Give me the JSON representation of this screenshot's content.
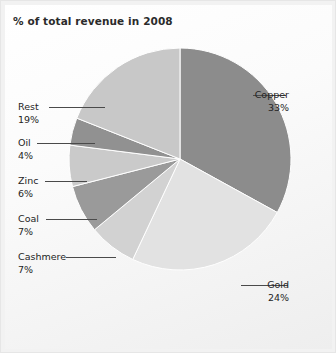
{
  "chart": {
    "title": "% of total revenue in 2008"
  },
  "chart_data": {
    "type": "pie",
    "title": "% of total revenue in 2008",
    "xlabel": "",
    "ylabel": "",
    "legend_position": "none",
    "grid": false,
    "unit": "%",
    "total": 100,
    "start_angle_deg": 0,
    "direction": "clockwise",
    "labels": [
      "Copper",
      "Gold",
      "Cashmere",
      "Coal",
      "Zinc",
      "Oil",
      "Rest"
    ],
    "values": [
      33,
      24,
      7,
      7,
      6,
      4,
      19
    ],
    "value_labels": [
      "33%",
      "24%",
      "7%",
      "7%",
      "6%",
      "4%",
      "19%"
    ],
    "colors": [
      "#8c8c8c",
      "#e2e2e2",
      "#d2d2d2",
      "#9a9a9a",
      "#cacaca",
      "#919191",
      "#c8c8c8"
    ],
    "slices": [
      {
        "label": "Copper",
        "value": 33,
        "value_label": "33%",
        "color": "#8c8c8c"
      },
      {
        "label": "Gold",
        "value": 24,
        "value_label": "24%",
        "color": "#e2e2e2"
      },
      {
        "label": "Cashmere",
        "value": 7,
        "value_label": "7%",
        "color": "#d2d2d2"
      },
      {
        "label": "Coal",
        "value": 7,
        "value_label": "7%",
        "color": "#9a9a9a"
      },
      {
        "label": "Zinc",
        "value": 6,
        "value_label": "6%",
        "color": "#cacaca"
      },
      {
        "label": "Oil",
        "value": 4,
        "value_label": "4%",
        "color": "#919191"
      },
      {
        "label": "Rest",
        "value": 19,
        "value_label": "19%",
        "color": "#c8c8c8"
      }
    ]
  },
  "callouts": {
    "copper": {
      "name": "Copper",
      "value": "33%"
    },
    "gold": {
      "name": "Gold",
      "value": "24%"
    },
    "cashmere": {
      "name": "Cashmere",
      "value": "7%"
    },
    "coal": {
      "name": "Coal",
      "value": "7%"
    },
    "zinc": {
      "name": "Zinc",
      "value": "6%"
    },
    "oil": {
      "name": "Oil",
      "value": "4%"
    },
    "rest": {
      "name": "Rest",
      "value": "19%"
    }
  },
  "style": {
    "frame_background": "#f2f2f2",
    "plot_background": "#fbfbfb",
    "title_color": "#2b2b2b",
    "label_color": "#242424",
    "leader_color": "#4a4a4a",
    "slice_separator": "#ffffff"
  }
}
